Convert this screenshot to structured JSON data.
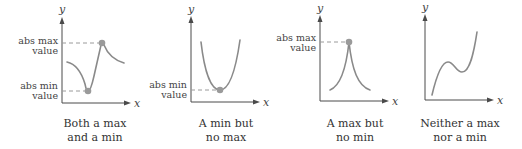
{
  "figure": {
    "colors": {
      "axis": "#4a4a4a",
      "curve": "#8a8a8a",
      "dashed_guide": "#9a9a9a",
      "point": "#9a9a9a",
      "text": "#333333"
    },
    "axis_labels": {
      "x": "x",
      "y": "y"
    },
    "panels": [
      {
        "id": "both",
        "caption_line1": "Both a max",
        "caption_line2": "and a min",
        "labels": {
          "max_line1": "abs max",
          "max_line2": "value",
          "min_line1": "abs min",
          "min_line2": "value"
        }
      },
      {
        "id": "min-only",
        "caption_line1": "A min but",
        "caption_line2": "no max",
        "labels": {
          "min_line1": "abs min",
          "min_line2": "value"
        }
      },
      {
        "id": "max-only",
        "caption_line1": "A max but",
        "caption_line2": "no min",
        "labels": {
          "max_line1": "abs max",
          "max_line2": "value"
        }
      },
      {
        "id": "neither",
        "caption_line1": "Neither a max",
        "caption_line2": "nor a min",
        "labels": {}
      }
    ]
  }
}
